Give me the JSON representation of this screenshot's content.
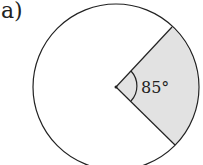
{
  "label": "a)",
  "diagram": {
    "type": "circle-sector",
    "angle_label": "85°",
    "angle_degrees": 85,
    "colors": {
      "sector_fill": "#e2e2e2",
      "stroke": "#222222",
      "background": "#ffffff"
    }
  }
}
